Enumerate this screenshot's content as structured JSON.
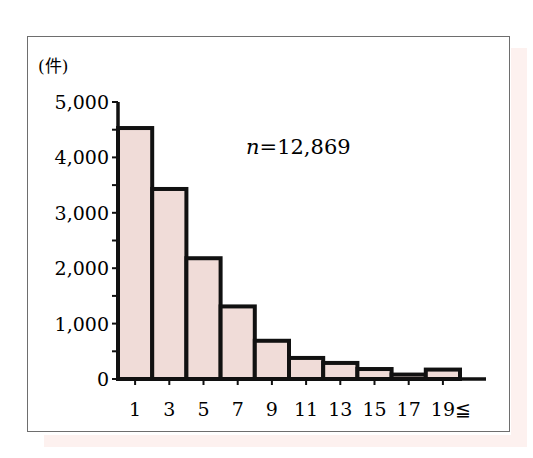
{
  "chart_data": {
    "type": "bar",
    "title": "",
    "xlabel": "",
    "ylabel": "(件)",
    "unit_label": "(件)",
    "categories": [
      "1",
      "3",
      "5",
      "7",
      "9",
      "11",
      "13",
      "15",
      "17",
      "19≦"
    ],
    "values": [
      4530,
      3430,
      2180,
      1310,
      690,
      380,
      290,
      180,
      80,
      170
    ],
    "ylim": [
      0,
      5000
    ],
    "yticks": [
      0,
      1000,
      2000,
      3000,
      4000,
      5000
    ],
    "ytick_labels": [
      "0",
      "1,000",
      "2,000",
      "3,000",
      "4,000",
      "5,000"
    ],
    "yminor_step": 500,
    "annotation": "n=12,869",
    "annotation_var": "n",
    "annotation_value": "=12,869",
    "grid": false,
    "legend": null,
    "colors": {
      "bar_fill": "#f0dcd8",
      "bar_edge": "#111111",
      "frame": "#6e6e6e"
    }
  }
}
